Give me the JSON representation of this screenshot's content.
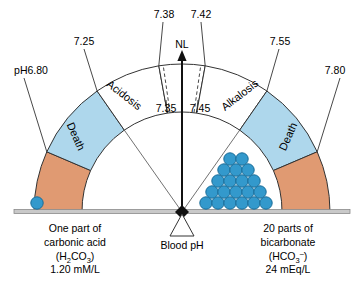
{
  "diagram": {
    "arc": {
      "pointer_label": "NL",
      "zones": [
        {
          "id": "death-left",
          "label": "Death",
          "color": "#e09a72",
          "from_ph": "6.80",
          "to_ph": "7.00"
        },
        {
          "id": "acidosis",
          "label": "Acidosis",
          "color": "#aed7ec",
          "from_ph": "7.00",
          "to_ph": "7.25"
        },
        {
          "id": "acidosis-mild",
          "label": "",
          "color": "#ffffff",
          "from_ph": "7.25",
          "to_ph": "7.38"
        },
        {
          "id": "normal",
          "label": "NL",
          "color": "#ffffff",
          "from_ph": "7.38",
          "to_ph": "7.42"
        },
        {
          "id": "alkalosis-mild",
          "label": "",
          "color": "#ffffff",
          "from_ph": "7.42",
          "to_ph": "7.55"
        },
        {
          "id": "alkalosis",
          "label": "Alkalosis",
          "color": "#aed7ec",
          "from_ph": "7.55",
          "to_ph": "7.70"
        },
        {
          "id": "death-right",
          "label": "Death",
          "color": "#e09a72",
          "from_ph": "7.70",
          "to_ph": "7.80"
        }
      ],
      "tick_labels": {
        "far_left": "pH6.80",
        "left_outer": "7.25",
        "left_inner_top": "7.38",
        "left_inner_bottom": "7.35",
        "right_inner_top": "7.42",
        "right_inner_bottom": "7.45",
        "right_outer": "7.55",
        "far_right": "7.80"
      }
    },
    "balance": {
      "fulcrum_label": "Blood pH",
      "left_pan": {
        "line1": "One part of",
        "line2": "carbonic acid",
        "formula_base": "(H",
        "formula_sub1": "2",
        "formula_mid": "CO",
        "formula_sub2": "3",
        "formula_end": ")",
        "concentration": "1.20 mM/L",
        "ball_count": 1
      },
      "right_pan": {
        "line1": "20 parts of",
        "line2": "bicarbonate",
        "formula_base": "(HCO",
        "formula_sub1": "3",
        "formula_sup1": "–",
        "formula_end": ")",
        "concentration": "24 mEq/L",
        "ball_count": 20,
        "pyramid_rows": [
          2,
          3,
          4,
          5,
          6
        ]
      }
    },
    "colors": {
      "acidosis_alkalosis": "#aed7ec",
      "death": "#e09a72",
      "ball": "#3399cc",
      "ball_stroke": "#1a6d99",
      "outline": "#333333",
      "beam": "#9a9a9a"
    }
  }
}
